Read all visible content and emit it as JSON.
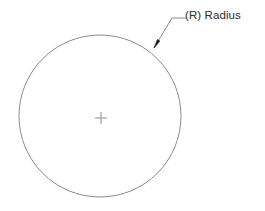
{
  "drawing": {
    "title": "Radius Dimension Callout",
    "background_color": "#ffffff",
    "geometry_color": "#8c8c8c",
    "leader_color": "#8a8a8a",
    "arrow_color": "#1a1a1a",
    "text_color": "#2b2b2b",
    "circle": {
      "name": "circle",
      "center_x": 100,
      "center_y": 116,
      "radius": 81,
      "stroke_width": 1,
      "fill": "none"
    },
    "center_mark": {
      "name": "center-cross",
      "x": 101,
      "y": 118,
      "arm_length": 6,
      "stroke_width": 1,
      "color": "#8c8c8c"
    },
    "leader": {
      "name": "leader-line",
      "arrow_tip_x": 154,
      "arrow_tip_y": 48,
      "elbow_x": 172,
      "elbow_y": 18,
      "shelf_end_x": 186,
      "shelf_end_y": 18,
      "stroke_width": 1,
      "arrow_length": 9,
      "arrow_width": 3
    },
    "callout": {
      "label": "(R) Radius",
      "symbol": "(R)",
      "term": "Radius",
      "x": 185,
      "y": 8,
      "font_size": 11.5
    }
  }
}
